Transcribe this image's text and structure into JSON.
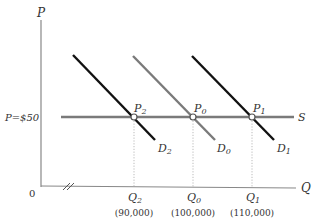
{
  "axes": {
    "y_label": "P",
    "x_label": "Q",
    "origin_label": "0",
    "price_label": "P=$50"
  },
  "supply": {
    "label": "S",
    "color": "#7a7a7a"
  },
  "demand_curves": [
    {
      "id": "D2",
      "label": "D",
      "sub": "2",
      "color": "#111111"
    },
    {
      "id": "D0",
      "label": "D",
      "sub": "0",
      "color": "#7a7a7a"
    },
    {
      "id": "D1",
      "label": "D",
      "sub": "1",
      "color": "#111111"
    }
  ],
  "equilibria": [
    {
      "label": "P",
      "sub": "2",
      "q_label": "Q",
      "q_sub": "2",
      "q_value": "(90,000)"
    },
    {
      "label": "P",
      "sub": "0",
      "q_label": "Q",
      "q_sub": "0",
      "q_value": "(100,000)"
    },
    {
      "label": "P",
      "sub": "1",
      "q_label": "Q",
      "q_sub": "1",
      "q_value": "(110,000)"
    }
  ]
}
